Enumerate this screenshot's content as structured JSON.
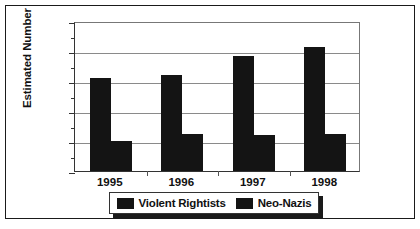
{
  "chart_data": {
    "type": "bar",
    "title": "",
    "xlabel": "",
    "ylabel": "Estimated Number",
    "categories": [
      "1995",
      "1996",
      "1997",
      "1998"
    ],
    "series": [
      {
        "name": "Violent Rightists",
        "values": [
          6200,
          6400,
          7700,
          8300
        ],
        "color": "#141414"
      },
      {
        "name": "Neo-Nazis",
        "values": [
          2000,
          2450,
          2400,
          2500
        ],
        "color": "#141414"
      }
    ],
    "ylim": [
      0,
      10000
    ],
    "ytick_labels": [
      "0",
      "2000",
      "4000",
      "6000",
      "8000",
      "10000"
    ],
    "ytick_values": [
      0,
      2000,
      4000,
      6000,
      8000,
      10000
    ],
    "yminor_values": [
      1000,
      3000,
      5000,
      7000,
      9000
    ],
    "grid": true,
    "legend_position": "bottom"
  },
  "legend": {
    "entries": [
      {
        "label": "Violent Rightists"
      },
      {
        "label": "Neo-Nazis"
      }
    ]
  }
}
